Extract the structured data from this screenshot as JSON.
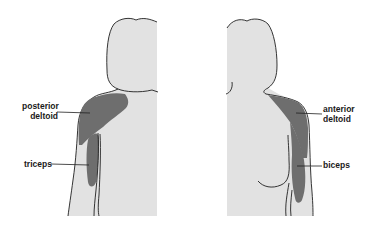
{
  "diagram": {
    "views": [
      {
        "id": "posterior",
        "description": "back view",
        "labels": [
          {
            "line1": "posterior",
            "line2": "deltoid"
          },
          {
            "line1": "triceps"
          }
        ]
      },
      {
        "id": "anterior",
        "description": "front view",
        "labels": [
          {
            "line1": "anterior",
            "line2": "deltoid"
          },
          {
            "line1": "biceps"
          }
        ]
      }
    ],
    "colors": {
      "body_fill": "#e2e2e2",
      "muscle_fill": "#6e6e6e",
      "outline": "#1f1f1f",
      "label_text": "#1a1a1a"
    }
  }
}
